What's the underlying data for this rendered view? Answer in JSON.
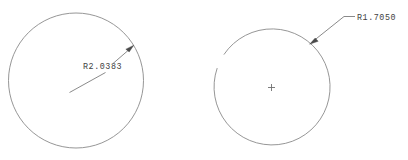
{
  "drawing": {
    "title": "Radius dimension sketch",
    "background_color": "#ffffff",
    "line_color": "#8a8a8a",
    "text_color": "#3f3f3f",
    "arrow_color": "#4a4a4a"
  },
  "left_figure": {
    "name": "full-circle",
    "shape": "circle",
    "center": {
      "x": 76,
      "y": 80.5
    },
    "radius": 67.5,
    "dimension": {
      "label": "R2.0383",
      "value": 2.0383,
      "prefix": "R",
      "text_position": {
        "x": 83,
        "y": 69
      },
      "leader_tail_start": {
        "x": 69.5,
        "y": 92.5
      },
      "leader_tail_end": {
        "x": 81,
        "y": 86
      },
      "leader_head_start": {
        "x": 112,
        "y": 64
      },
      "arrow_tip": {
        "x": 133.5,
        "y": 45.5
      },
      "arrow_angle_deg": 220
    }
  },
  "right_figure": {
    "name": "open-arc",
    "shape": "arc",
    "center": {
      "x": 272,
      "y": 87
    },
    "radius": 58,
    "start_angle_deg": 146,
    "end_angle_deg": 199,
    "sweep": "clockwise-major",
    "center_mark": {
      "label": "+",
      "position": {
        "x": 271.5,
        "y": 87.5
      },
      "size": 7
    },
    "dimension": {
      "label": "R1.7050",
      "value": 1.705,
      "prefix": "R",
      "text_position": {
        "x": 358,
        "y": 21
      },
      "leader_shoulder_start": {
        "x": 355,
        "y": 16.5
      },
      "leader_shoulder_end": {
        "x": 344,
        "y": 16.5
      },
      "arrow_tip": {
        "x": 310,
        "y": 43.5
      },
      "arrow_angle_deg": 218
    }
  }
}
